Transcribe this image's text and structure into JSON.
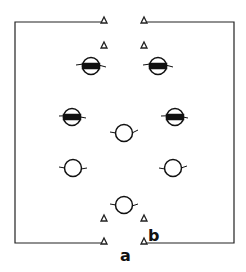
{
  "diagram": {
    "field": {
      "left": 15,
      "right": 234,
      "top": 22,
      "bottom": 243,
      "gap_left": 101,
      "gap_right": 147,
      "stroke": "#222222"
    },
    "cones": [
      {
        "x": 104,
        "y": 20
      },
      {
        "x": 144,
        "y": 20
      },
      {
        "x": 104,
        "y": 45
      },
      {
        "x": 144,
        "y": 45
      },
      {
        "x": 104,
        "y": 218
      },
      {
        "x": 144,
        "y": 218
      },
      {
        "x": 104,
        "y": 241
      },
      {
        "x": 144,
        "y": 241
      }
    ],
    "shaded_players": [
      {
        "x": 91,
        "y": 66
      },
      {
        "x": 158,
        "y": 66
      },
      {
        "x": 72,
        "y": 117
      },
      {
        "x": 175,
        "y": 117
      }
    ],
    "open_players": [
      {
        "x": 124,
        "y": 133
      },
      {
        "x": 73,
        "y": 168
      },
      {
        "x": 173,
        "y": 168
      },
      {
        "x": 124,
        "y": 205
      }
    ],
    "labels": {
      "a": "a",
      "b": "b"
    }
  }
}
